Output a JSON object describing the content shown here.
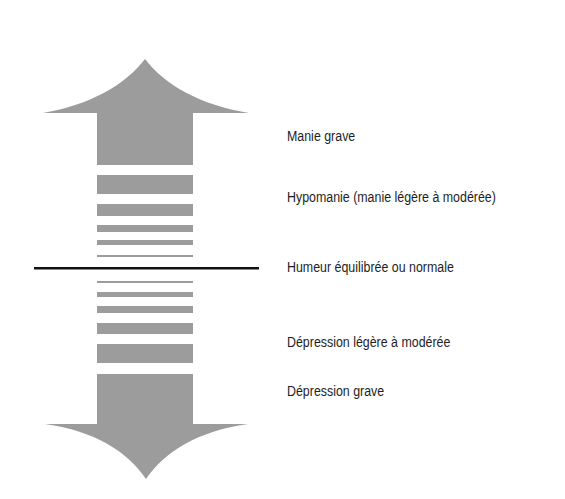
{
  "diagram": {
    "type": "mood-spectrum-arrow",
    "colors": {
      "arrow_fill": "#9c9c9c",
      "divider": "#111111",
      "text": "#1e1e1e"
    },
    "labels": [
      {
        "id": "mania-severe",
        "text": "Manie grave"
      },
      {
        "id": "hypomania",
        "text": "Hypomanie (manie légère à modérée)"
      },
      {
        "id": "euthymia",
        "text": "Humeur équilibrée ou normale"
      },
      {
        "id": "depression-mild",
        "text": "Dépression légère à modérée"
      },
      {
        "id": "depression-severe",
        "text": "Dépression grave"
      }
    ]
  }
}
